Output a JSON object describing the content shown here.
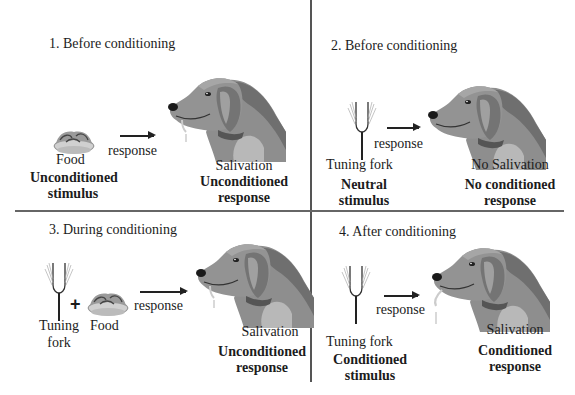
{
  "panels": [
    {
      "title": "1. Before conditioning",
      "stimulus": {
        "name": "Food",
        "type_line1": "Unconditioned",
        "type_line2": "stimulus"
      },
      "arrow_label": "response",
      "response": {
        "name": "Salivation",
        "type_line1": "Unconditioned",
        "type_line2": "response"
      }
    },
    {
      "title": "2. Before conditioning",
      "stimulus": {
        "name": "Tuning fork",
        "type_line1": "Neutral",
        "type_line2": "stimulus"
      },
      "arrow_label": "response",
      "response": {
        "name": "No Salivation",
        "type_line1": "No conditioned",
        "type_line2": "response"
      }
    },
    {
      "title": "3. During conditioning",
      "stimulus": {
        "name_a_line1": "Tuning",
        "name_a_line2": "fork",
        "plus": "+",
        "name_b": "Food"
      },
      "arrow_label": "response",
      "response": {
        "name": "Salivation",
        "type_line1": "Unconditioned",
        "type_line2": "response"
      }
    },
    {
      "title": "4. After conditioning",
      "stimulus": {
        "name": "Tuning fork",
        "type_line1": "Conditioned",
        "type_line2": "stimulus"
      },
      "arrow_label": "response",
      "response": {
        "name": "Salivation",
        "type_line1": "Conditioned",
        "type_line2": "response"
      }
    }
  ],
  "icons": {
    "food": "food-bowl-icon",
    "fork": "tuning-fork-icon",
    "dog": "dog-head-icon"
  },
  "colors": {
    "dog_main": "#8a8a8a",
    "dog_dark": "#6e6e6e",
    "dog_light": "#b4b4b4",
    "line": "#555555"
  }
}
